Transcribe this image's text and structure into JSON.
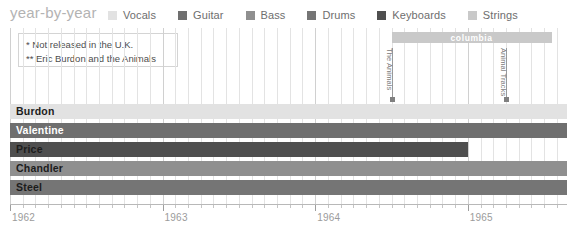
{
  "header": {
    "title": "year-by-year"
  },
  "legend": {
    "items": [
      {
        "label": "Vocals",
        "color": "#e2e2e2"
      },
      {
        "label": "Guitar",
        "color": "#6f6f6f"
      },
      {
        "label": "Bass",
        "color": "#8f8f8f"
      },
      {
        "label": "Drums",
        "color": "#757575"
      },
      {
        "label": "Keyboards",
        "color": "#4f4f4f"
      },
      {
        "label": "Strings",
        "color": "#c9c9c9"
      }
    ]
  },
  "footnotes": {
    "lines": [
      "* Not released in the U.K.",
      "** Eric Burdon and the Animals"
    ]
  },
  "label_bar": {
    "text": "columbia",
    "color": "#c9c9c9",
    "start": 1964.5,
    "end": 1965.55
  },
  "releases": [
    {
      "title": "The Animals",
      "year": 1964.5
    },
    {
      "title": "Animal Tracks",
      "year": 1965.25
    }
  ],
  "chart_data": {
    "type": "bar",
    "title": "year-by-year",
    "orientation": "horizontal-timeline",
    "xlabel": "",
    "ylabel": "",
    "xlim": [
      1962.0,
      1965.65
    ],
    "tick_labels": [
      "1962",
      "1963",
      "1964",
      "1965"
    ],
    "tick_values": [
      1962,
      1963,
      1964,
      1965
    ],
    "minor_ticks_per_year": 12,
    "grid": true,
    "legend_position": "top",
    "categories": [
      "Burdon",
      "Valentine",
      "Price",
      "Chandler",
      "Steel"
    ],
    "series": [
      {
        "name": "Burdon",
        "role": "Vocals",
        "color": "#e2e2e2",
        "label_on_dark": false,
        "start": 1962.0,
        "end": 1965.65
      },
      {
        "name": "Valentine",
        "role": "Guitar",
        "color": "#6f6f6f",
        "label_on_dark": true,
        "start": 1962.0,
        "end": 1965.65
      },
      {
        "name": "Price",
        "role": "Keyboards",
        "color": "#4f4f4f",
        "label_on_dark": false,
        "start": 1962.0,
        "end": 1965.0
      },
      {
        "name": "Chandler",
        "role": "Bass",
        "color": "#8f8f8f",
        "label_on_dark": false,
        "start": 1962.0,
        "end": 1965.65
      },
      {
        "name": "Steel",
        "role": "Drums",
        "color": "#757575",
        "label_on_dark": false,
        "start": 1962.0,
        "end": 1965.65
      }
    ]
  }
}
